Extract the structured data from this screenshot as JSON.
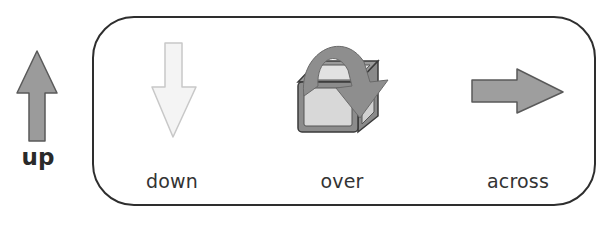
{
  "items": [
    {
      "id": "up",
      "label": "up",
      "icon": "arrow-up-icon",
      "style": "bold",
      "fill": "#9b9b9b"
    },
    {
      "id": "down",
      "label": "down",
      "icon": "arrow-down-icon",
      "fill": "#f2f2f2"
    },
    {
      "id": "over",
      "label": "over",
      "icon": "arrow-over-box-icon",
      "fill": "#8e8e8e"
    },
    {
      "id": "across",
      "label": "across",
      "icon": "arrow-right-icon",
      "fill": "#9e9e9e"
    }
  ],
  "colors": {
    "outline": "#5a5a5a",
    "frame": "#2e2e2e",
    "light_outline": "#c8c8c8",
    "box_face": "#d6d6d6"
  }
}
